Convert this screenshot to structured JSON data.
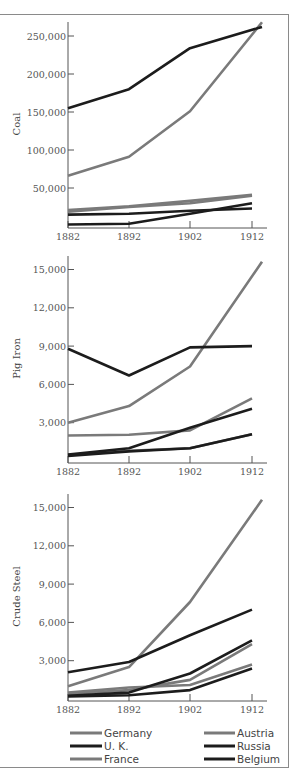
{
  "chart_data": [
    {
      "type": "line",
      "title": "",
      "xlabel": "",
      "ylabel": "Coal",
      "categories": [
        "1882",
        "1892",
        "1902",
        "1912"
      ],
      "yticks": [
        "50,000",
        "100,000",
        "150,000",
        "200,000",
        "250,000"
      ],
      "ylim": [
        0,
        270000
      ],
      "series": [
        {
          "name": "Germany",
          "values": [
            66000,
            91000,
            151000,
            268000
          ]
        },
        {
          "name": "U. K.",
          "values": [
            155000,
            180000,
            234000,
            262000
          ]
        },
        {
          "name": "France",
          "values": [
            21000,
            26000,
            33000,
            41000
          ]
        },
        {
          "name": "Austria",
          "values": [
            19000,
            25000,
            30000,
            40000
          ]
        },
        {
          "name": "Russia",
          "values": [
            2000,
            3000,
            16000,
            30000
          ]
        },
        {
          "name": "Belgium",
          "values": [
            15000,
            16000,
            20000,
            23000
          ]
        }
      ]
    },
    {
      "type": "line",
      "title": "",
      "xlabel": "",
      "ylabel": "Pig Iron",
      "categories": [
        "1882",
        "1892",
        "1902",
        "1912"
      ],
      "yticks": [
        "3,000",
        "6,000",
        "9,000",
        "12,000",
        "15,000"
      ],
      "ylim": [
        0,
        16000
      ],
      "series": [
        {
          "name": "Germany",
          "values": [
            3000,
            4300,
            7400,
            15600
          ]
        },
        {
          "name": "U. K.",
          "values": [
            8800,
            6700,
            8900,
            9000
          ]
        },
        {
          "name": "France",
          "values": [
            2000,
            2050,
            2400,
            4900
          ]
        },
        {
          "name": "Austria",
          "values": [
            450,
            800,
            1000,
            2100
          ]
        },
        {
          "name": "Russia",
          "values": [
            500,
            1000,
            2600,
            4100
          ]
        },
        {
          "name": "Belgium",
          "values": [
            400,
            750,
            1000,
            2100
          ]
        }
      ]
    },
    {
      "type": "line",
      "title": "",
      "xlabel": "",
      "ylabel": "Crude Steel",
      "categories": [
        "1882",
        "1892",
        "1902",
        "1912"
      ],
      "yticks": [
        "3,000",
        "6,000",
        "9,000",
        "12,000",
        "15,000"
      ],
      "ylim": [
        0,
        16000
      ],
      "series": [
        {
          "name": "Germany",
          "values": [
            1000,
            2500,
            7600,
            15600
          ]
        },
        {
          "name": "U. K.",
          "values": [
            2100,
            2900,
            5000,
            7000
          ]
        },
        {
          "name": "France",
          "values": [
            400,
            700,
            1500,
            4300
          ]
        },
        {
          "name": "Austria",
          "values": [
            500,
            900,
            1100,
            2700
          ]
        },
        {
          "name": "Russia",
          "values": [
            250,
            500,
            2000,
            4600
          ]
        },
        {
          "name": "Belgium",
          "values": [
            200,
            300,
            700,
            2400
          ]
        }
      ]
    }
  ],
  "legend": {
    "items": [
      {
        "name": "Germany",
        "color": "#7a7a7a"
      },
      {
        "name": "U. K.",
        "color": "#1c1c1c"
      },
      {
        "name": "France",
        "color": "#7a7a7a"
      },
      {
        "name": "Austria",
        "color": "#7a7a7a"
      },
      {
        "name": "Russia",
        "color": "#1c1c1c"
      },
      {
        "name": "Belgium",
        "color": "#1c1c1c"
      }
    ]
  },
  "colors": {
    "gray": "#7a7a7a",
    "black": "#1c1c1c",
    "axis": "#555555",
    "border": "#8a8a8a"
  }
}
